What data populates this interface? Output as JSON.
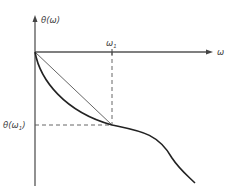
{
  "diagram": {
    "type": "phase-response-plot",
    "y_axis_label": "θ(ω)",
    "x_axis_label": "ω",
    "tick_x_label": "ω",
    "tick_x_sub": "1",
    "tick_y_label_prefix": "θ(ω",
    "tick_y_sub": "1",
    "tick_y_label_suffix": ")",
    "colors": {
      "axis": "#555555",
      "curve": "#222222",
      "chord": "#666666",
      "dashed": "#555555"
    },
    "elements": [
      "horizontal axis (ω) with arrow",
      "vertical axis θ(ω) with arrow",
      "curved phase response θ(ω) starting at origin, passing through (ω1, θ(ω1)) and continuing down",
      "straight chord from origin to (ω1, θ(ω1))",
      "dashed vertical line at ω1",
      "dashed horizontal line at θ(ω1)"
    ]
  }
}
